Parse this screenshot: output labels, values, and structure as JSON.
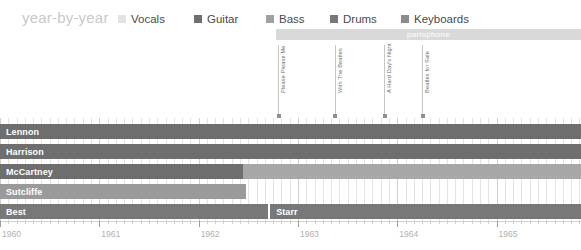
{
  "header": {
    "title": "year-by-year",
    "title_color": "#c9c9c9"
  },
  "legend": {
    "items": [
      {
        "label": "Vocals",
        "color": "#e3e3e3",
        "x": 0
      },
      {
        "label": "Guitar",
        "color": "#6e6e6e",
        "x": 76
      },
      {
        "label": "Bass",
        "color": "#a0a0a0",
        "x": 148
      },
      {
        "label": "Drums",
        "color": "#787878",
        "x": 212
      },
      {
        "label": "Keyboards",
        "color": "#8c8c8c",
        "x": 283
      }
    ]
  },
  "chart_data": {
    "type": "bar",
    "title": "year-by-year",
    "xlabel": "",
    "ylabel": "",
    "orientation": "horizontal",
    "grid": true,
    "legend_position": "top",
    "xlim": [
      1960.0,
      1965.85
    ],
    "x_tick_labels": [
      "1960",
      "1961",
      "1962",
      "1963",
      "1964",
      "1965"
    ],
    "x_ticks": [
      1960,
      1961,
      1962,
      1963,
      1964,
      1965
    ],
    "minor_tick_interval_months": 1,
    "categories": [
      "Lennon",
      "Harrison",
      "McCartney",
      "Sutcliffe",
      "Best",
      "Starr"
    ],
    "series": [
      {
        "name": "Lennon",
        "segments": [
          {
            "instrument": "Guitar",
            "color": "#6e6e6e",
            "start": 1960.0,
            "end": 1965.85
          }
        ]
      },
      {
        "name": "Harrison",
        "segments": [
          {
            "instrument": "Guitar",
            "color": "#6e6e6e",
            "start": 1960.0,
            "end": 1965.85
          }
        ]
      },
      {
        "name": "McCartney",
        "segments": [
          {
            "instrument": "Guitar",
            "color": "#6e6e6e",
            "start": 1960.0,
            "end": 1962.45
          },
          {
            "instrument": "Bass",
            "color": "#a7a7a7",
            "start": 1962.45,
            "end": 1965.85
          }
        ]
      },
      {
        "name": "Sutcliffe",
        "segments": [
          {
            "instrument": "Bass",
            "color": "#9a9a9a",
            "start": 1960.0,
            "end": 1962.48
          }
        ]
      },
      {
        "name": "Best",
        "segments": [
          {
            "instrument": "Drums",
            "color": "#787878",
            "start": 1960.0,
            "end": 1962.7
          }
        ]
      },
      {
        "name": "Starr",
        "segments": [
          {
            "instrument": "Drums",
            "color": "#787878",
            "start": 1962.72,
            "end": 1965.85
          }
        ]
      }
    ],
    "rows": [
      {
        "label": "Lennon",
        "y": 124,
        "series": [
          "Lennon"
        ]
      },
      {
        "label": "Harrison",
        "y": 144,
        "series": [
          "Harrison"
        ]
      },
      {
        "label": "McCartney",
        "y": 164,
        "series": [
          "McCartney"
        ]
      },
      {
        "label": "Sutcliffe",
        "y": 184,
        "series": [
          "Sutcliffe"
        ]
      },
      {
        "label": "Best",
        "y": 204,
        "series": [
          "Best",
          "Starr"
        ]
      }
    ],
    "label_bands": [
      {
        "name": "parlophone",
        "start": 1962.78,
        "end": 1965.85,
        "color": "#d9d9d9",
        "text_color": "#ffffff"
      }
    ],
    "annotations": [
      {
        "label": "Please Please Me",
        "x": 1962.8
      },
      {
        "label": "With The Beatles",
        "x": 1963.37
      },
      {
        "label": "A Hard Day's Night",
        "x": 1963.87
      },
      {
        "label": "Beatles for Sale",
        "x": 1964.25
      }
    ]
  }
}
